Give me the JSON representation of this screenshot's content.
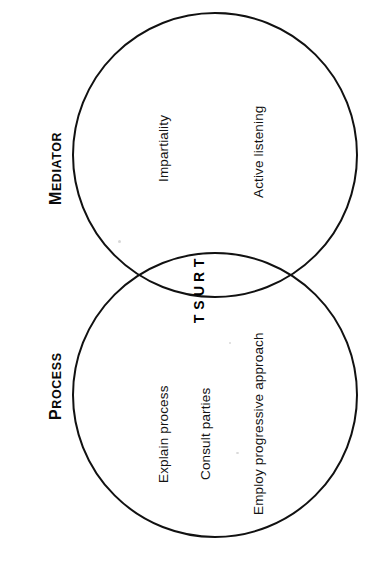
{
  "diagram": {
    "type": "venn",
    "orientation": "rotated-90-ccw",
    "background_color": "#ffffff",
    "stroke_color": "#111111",
    "text_color": "#131313",
    "sets": [
      {
        "id": "mediator",
        "label": "MEDIATOR",
        "label_first_char": "M",
        "label_rest": "EDIATOR",
        "items": [
          "Impartiality",
          "Active listening"
        ]
      },
      {
        "id": "process",
        "label": "PROCESS",
        "label_first_char": "P",
        "label_rest": "ROCESS",
        "items": [
          "Explain process",
          "Consult parties",
          "Employ progressive approach"
        ]
      }
    ],
    "intersection": {
      "label": "TRUST",
      "letters": [
        "T",
        "R",
        "U",
        "S",
        "T"
      ]
    }
  }
}
